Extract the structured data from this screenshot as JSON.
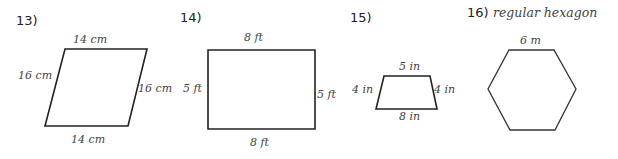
{
  "problems": [
    {
      "number": "13)",
      "shape": "parallelogram",
      "labels": {
        "top": "14 cm",
        "left": "16 cm",
        "right": "16 cm",
        "bottom": "14 cm"
      }
    },
    {
      "number": "14)",
      "shape": "rectangle",
      "labels": {
        "top": "8 ft",
        "left": "5 ft",
        "right": "5 ft",
        "bottom": "8 ft"
      }
    },
    {
      "number": "15)",
      "shape": "trapezoid",
      "labels": {
        "top": "5 in",
        "left": "4 in",
        "right": "4 in",
        "bottom": "8 in"
      }
    },
    {
      "number": "16)",
      "shape": "regular hexagon",
      "title": "regular hexagon",
      "labels": {
        "top": "6 m"
      }
    }
  ],
  "colors": {
    "stroke": "#222222",
    "text": "#444444"
  }
}
